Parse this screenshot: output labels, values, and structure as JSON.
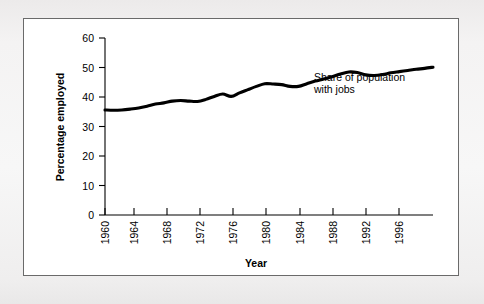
{
  "figure": {
    "background_color": "#f2f2f2",
    "panel_color": "#ffffff",
    "panel_border_color": "#6a6a6a",
    "line_color": "#000000"
  },
  "chart_data": {
    "type": "line",
    "title": "",
    "xlabel": "Year",
    "ylabel": "Percentage employed",
    "xlim": [
      1960,
      1999
    ],
    "ylim": [
      0,
      60
    ],
    "grid": false,
    "legend": "none",
    "y_ticks": [
      0,
      10,
      20,
      30,
      40,
      50,
      60
    ],
    "y_tick_labels": [
      "0",
      "10",
      "20",
      "30",
      "40",
      "50",
      "60"
    ],
    "x_ticks": [
      1960,
      1964,
      1968,
      1972,
      1976,
      1980,
      1984,
      1988,
      1992,
      1996
    ],
    "x_tick_labels": [
      "1960",
      "1964",
      "1968",
      "1972",
      "1976",
      "1980",
      "1984",
      "1988",
      "1992",
      "1996"
    ],
    "x_tick_rotation": 90,
    "annotations": [
      {
        "name": "series-annotation",
        "line1": "Share of population",
        "line2": "with jobs"
      }
    ],
    "series": [
      {
        "name": "Share of population with jobs",
        "x": [
          1960,
          1961,
          1962,
          1963,
          1964,
          1965,
          1966,
          1967,
          1968,
          1969,
          1970,
          1971,
          1972,
          1973,
          1974,
          1975,
          1976,
          1977,
          1978,
          1979,
          1980,
          1981,
          1982,
          1983,
          1984,
          1985,
          1986,
          1987,
          1988,
          1989,
          1990,
          1991,
          1992,
          1993,
          1994,
          1995,
          1996,
          1997,
          1998,
          1999
        ],
        "values": [
          35.6,
          35.5,
          35.6,
          35.9,
          36.3,
          36.9,
          37.6,
          38.0,
          38.6,
          38.8,
          38.6,
          38.5,
          39.2,
          40.2,
          41.0,
          40.2,
          41.4,
          42.5,
          43.6,
          44.5,
          44.4,
          44.2,
          43.6,
          43.6,
          44.5,
          45.4,
          46.1,
          46.9,
          47.8,
          48.5,
          48.3,
          47.5,
          47.3,
          47.6,
          48.2,
          48.6,
          49.0,
          49.4,
          49.7,
          50.1
        ]
      }
    ]
  }
}
